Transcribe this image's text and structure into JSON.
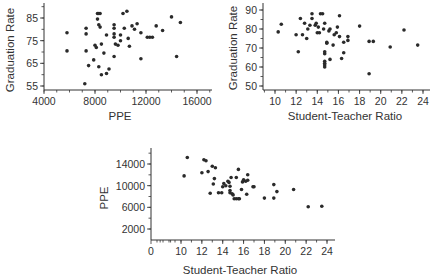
{
  "chart_data": [
    {
      "id": "ppe-vs-grad",
      "type": "scatter",
      "title": "",
      "xlabel": "PPE",
      "ylabel": "Graduation Rate",
      "xlim": [
        4000,
        17000
      ],
      "ylim": [
        53,
        93
      ],
      "xticks": [
        4000,
        8000,
        12000,
        16000
      ],
      "yticks": [
        55,
        65,
        75,
        85
      ],
      "grid": false,
      "points": [
        [
          5800,
          78.5
        ],
        [
          5800,
          70.5
        ],
        [
          7300,
          80.5
        ],
        [
          7300,
          78
        ],
        [
          7300,
          70.5
        ],
        [
          7200,
          56
        ],
        [
          7500,
          64
        ],
        [
          7900,
          66.5
        ],
        [
          8000,
          73
        ],
        [
          8100,
          72
        ],
        [
          8200,
          87
        ],
        [
          8300,
          87
        ],
        [
          8400,
          87
        ],
        [
          8200,
          84.5
        ],
        [
          8300,
          82
        ],
        [
          8400,
          81
        ],
        [
          8500,
          73.5
        ],
        [
          8300,
          63.5
        ],
        [
          8500,
          60
        ],
        [
          8700,
          69.5
        ],
        [
          8900,
          77.5
        ],
        [
          8900,
          60.5
        ],
        [
          9100,
          62.5
        ],
        [
          9500,
          82
        ],
        [
          9500,
          80.5
        ],
        [
          9500,
          78
        ],
        [
          9500,
          76.5
        ],
        [
          9600,
          73.5
        ],
        [
          9500,
          68
        ],
        [
          9800,
          73
        ],
        [
          10000,
          75
        ],
        [
          10000,
          77.5
        ],
        [
          10200,
          87
        ],
        [
          10300,
          80.5
        ],
        [
          10500,
          88
        ],
        [
          10600,
          76
        ],
        [
          10700,
          72.5
        ],
        [
          10900,
          81.5
        ],
        [
          11100,
          80
        ],
        [
          11300,
          82.5
        ],
        [
          11600,
          78.5
        ],
        [
          11600,
          67
        ],
        [
          12100,
          76.5
        ],
        [
          12300,
          76.5
        ],
        [
          12500,
          76.5
        ],
        [
          12800,
          81.5
        ],
        [
          13300,
          79.5
        ],
        [
          14000,
          85.5
        ],
        [
          14400,
          68
        ],
        [
          14700,
          83
        ]
      ]
    },
    {
      "id": "str-vs-grad",
      "type": "scatter",
      "title": "",
      "xlabel": "Student-Teacher Ratio",
      "ylabel": "Graduation Rate",
      "xlim": [
        9,
        25
      ],
      "ylim": [
        48,
        93
      ],
      "xticks": [
        10,
        12,
        14,
        16,
        18,
        20,
        22,
        24
      ],
      "yticks": [
        50,
        60,
        70,
        80,
        90
      ],
      "grid": false,
      "points": [
        [
          10.3,
          78.5
        ],
        [
          10.6,
          82.5
        ],
        [
          12.0,
          77
        ],
        [
          12.2,
          68
        ],
        [
          12.4,
          85.5
        ],
        [
          12.6,
          77
        ],
        [
          12.8,
          83
        ],
        [
          13.0,
          75
        ],
        [
          13.1,
          80
        ],
        [
          13.3,
          82
        ],
        [
          13.5,
          88
        ],
        [
          13.5,
          85.5
        ],
        [
          13.8,
          82
        ],
        [
          13.9,
          83
        ],
        [
          14.0,
          78
        ],
        [
          14.1,
          81
        ],
        [
          14.2,
          78
        ],
        [
          14.3,
          88
        ],
        [
          14.5,
          88
        ],
        [
          14.6,
          80
        ],
        [
          14.7,
          83
        ],
        [
          14.7,
          68
        ],
        [
          14.7,
          67
        ],
        [
          14.7,
          63
        ],
        [
          14.7,
          62
        ],
        [
          14.7,
          61
        ],
        [
          14.7,
          60
        ],
        [
          14.9,
          73
        ],
        [
          14.9,
          72.5
        ],
        [
          15.1,
          79
        ],
        [
          15.2,
          80
        ],
        [
          15.2,
          64
        ],
        [
          15.5,
          71.5
        ],
        [
          15.6,
          77
        ],
        [
          15.8,
          78
        ],
        [
          15.9,
          81
        ],
        [
          16.1,
          87
        ],
        [
          16.1,
          76
        ],
        [
          16.3,
          64.5
        ],
        [
          16.5,
          73
        ],
        [
          16.5,
          67.5
        ],
        [
          16.9,
          76
        ],
        [
          16.9,
          74
        ],
        [
          18.0,
          81.5
        ],
        [
          18.9,
          73.5
        ],
        [
          18.9,
          56.5
        ],
        [
          19.3,
          73.5
        ],
        [
          20.9,
          70.5
        ],
        [
          22.2,
          79.5
        ],
        [
          23.5,
          71.5
        ]
      ]
    },
    {
      "id": "str-vs-ppe",
      "type": "scatter",
      "title": "",
      "xlabel": "Student-Teacher Ratio",
      "ylabel": "PPE",
      "xlim": [
        0,
        25
      ],
      "ylim": [
        0,
        17000
      ],
      "xticks": [
        0,
        10,
        12,
        14,
        16,
        18,
        20,
        22,
        24
      ],
      "yticks": [
        2000,
        6000,
        10000,
        14000
      ],
      "x_axis_break": true,
      "grid": false,
      "points": [
        [
          10.3,
          11800
        ],
        [
          10.6,
          15200
        ],
        [
          12.0,
          12400
        ],
        [
          12.2,
          14800
        ],
        [
          12.4,
          14600
        ],
        [
          12.6,
          12600
        ],
        [
          12.8,
          8600
        ],
        [
          13.0,
          13600
        ],
        [
          13.1,
          10300
        ],
        [
          13.2,
          11300
        ],
        [
          13.3,
          13300
        ],
        [
          13.6,
          8700
        ],
        [
          13.9,
          8700
        ],
        [
          14.0,
          9800
        ],
        [
          14.1,
          10400
        ],
        [
          14.3,
          10000
        ],
        [
          14.5,
          10800
        ],
        [
          14.6,
          10600
        ],
        [
          14.7,
          9900
        ],
        [
          14.7,
          9100
        ],
        [
          14.7,
          8700
        ],
        [
          14.8,
          11500
        ],
        [
          14.9,
          8500
        ],
        [
          15.0,
          8300
        ],
        [
          15.1,
          7600
        ],
        [
          15.3,
          7600
        ],
        [
          15.5,
          7600
        ],
        [
          15.3,
          11500
        ],
        [
          15.5,
          13000
        ],
        [
          15.6,
          7600
        ],
        [
          15.8,
          9300
        ],
        [
          15.9,
          10700
        ],
        [
          16.0,
          11100
        ],
        [
          16.2,
          10800
        ],
        [
          16.3,
          8400
        ],
        [
          16.4,
          11000
        ],
        [
          16.4,
          12000
        ],
        [
          16.9,
          9800
        ],
        [
          17.0,
          9800
        ],
        [
          18.0,
          7700
        ],
        [
          18.9,
          10200
        ],
        [
          18.9,
          7700
        ],
        [
          19.2,
          8900
        ],
        [
          20.8,
          9300
        ],
        [
          22.2,
          6100
        ],
        [
          23.5,
          6200
        ]
      ]
    }
  ]
}
